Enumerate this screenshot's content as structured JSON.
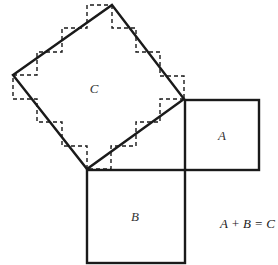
{
  "diagram": {
    "colors": {
      "stroke": "#1a1a1a",
      "label": "#333333",
      "background": "#ffffff"
    },
    "square_c": {
      "label": "C",
      "vertices": [
        [
          112,
          5
        ],
        [
          184,
          99
        ],
        [
          87,
          169
        ],
        [
          13,
          75
        ]
      ],
      "label_pos": [
        94,
        93
      ]
    },
    "square_a": {
      "label": "A",
      "rect": {
        "x": 185,
        "y": 100,
        "w": 74,
        "h": 70
      },
      "label_pos": [
        222,
        140
      ]
    },
    "square_b": {
      "label": "B",
      "rect": {
        "x": 87,
        "y": 170,
        "w": 98,
        "h": 93
      },
      "label_pos": [
        135,
        221
      ]
    },
    "staircase_paths": [
      [
        [
          13,
          75
        ],
        [
          37,
          75
        ],
        [
          37,
          52
        ],
        [
          62,
          52
        ],
        [
          62,
          28
        ],
        [
          87,
          28
        ],
        [
          87,
          5
        ],
        [
          112,
          5
        ]
      ],
      [
        [
          112,
          5
        ],
        [
          112,
          28
        ],
        [
          136,
          28
        ],
        [
          136,
          52
        ],
        [
          160,
          52
        ],
        [
          160,
          76
        ],
        [
          184,
          76
        ],
        [
          184,
          99
        ]
      ],
      [
        [
          184,
          99
        ],
        [
          160,
          99
        ],
        [
          160,
          122
        ],
        [
          136,
          122
        ],
        [
          136,
          146
        ],
        [
          111,
          146
        ],
        [
          111,
          169
        ],
        [
          87,
          169
        ]
      ],
      [
        [
          87,
          169
        ],
        [
          87,
          146
        ],
        [
          62,
          146
        ],
        [
          62,
          122
        ],
        [
          37,
          122
        ],
        [
          37,
          99
        ],
        [
          13,
          99
        ],
        [
          13,
          75
        ]
      ]
    ],
    "equation": {
      "text": "A + B = C",
      "pos": [
        220,
        228
      ]
    }
  }
}
